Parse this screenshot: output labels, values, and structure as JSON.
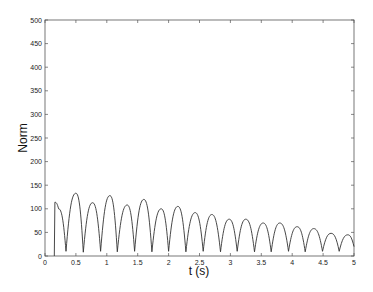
{
  "chart_data": {
    "type": "line",
    "title": "",
    "xlabel": "t (s)",
    "ylabel": "Norm",
    "xlim": [
      0,
      5
    ],
    "ylim": [
      0,
      500
    ],
    "grid": false,
    "legend": null,
    "xticks": [
      0,
      0.5,
      1,
      1.5,
      2,
      2.5,
      3,
      3.5,
      4,
      4.5,
      5
    ],
    "xtick_labels": [
      "0",
      "0.5",
      "1",
      "1.5",
      "2",
      "2.5",
      "3",
      "3.5",
      "4",
      "4.5",
      "5"
    ],
    "yticks": [
      0,
      50,
      100,
      150,
      200,
      250,
      300,
      350,
      400,
      450,
      500
    ],
    "ytick_labels": [
      "0",
      "50",
      "100",
      "150",
      "200",
      "250",
      "300",
      "350",
      "400",
      "450",
      "500"
    ],
    "series": [
      {
        "name": "Norm",
        "color": "#333333",
        "x": [
          0.15,
          0.16,
          0.22,
          0.34,
          0.5,
          0.62,
          0.77,
          0.9,
          1.05,
          1.17,
          1.33,
          1.45,
          1.6,
          1.73,
          1.88,
          2.0,
          2.15,
          2.28,
          2.43,
          2.56,
          2.7,
          2.84,
          2.98,
          3.11,
          3.25,
          3.39,
          3.53,
          3.66,
          3.8,
          3.94,
          4.08,
          4.21,
          4.35,
          4.49,
          4.63,
          4.76,
          4.9,
          5.0
        ],
        "y": [
          0,
          114,
          100,
          10,
          133,
          8,
          113,
          10,
          128,
          9,
          108,
          10,
          120,
          9,
          100,
          10,
          105,
          9,
          92,
          10,
          88,
          9,
          78,
          10,
          78,
          9,
          70,
          9,
          70,
          10,
          62,
          9,
          58,
          10,
          48,
          10,
          45,
          20
        ]
      }
    ]
  },
  "plot": {
    "frame_color": "#555555",
    "line_color": "#333333"
  }
}
